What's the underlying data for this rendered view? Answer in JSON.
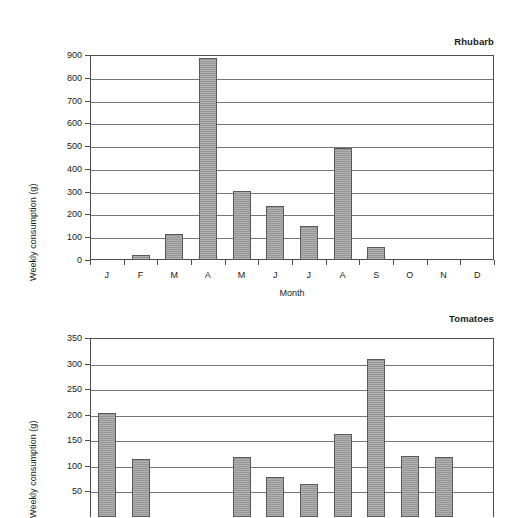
{
  "chart_data": [
    {
      "type": "bar",
      "title": "Rhubarb",
      "xlabel": "Month",
      "ylabel": "Weekly consumption (g)",
      "categories": [
        "J",
        "F",
        "M",
        "A",
        "M",
        "J",
        "J",
        "A",
        "S",
        "O",
        "N",
        "D"
      ],
      "values": [
        0,
        20,
        115,
        885,
        303,
        235,
        150,
        490,
        55,
        0,
        0,
        0
      ],
      "ylim": [
        0,
        900
      ],
      "ytick_labels": [
        "0",
        "100",
        "200",
        "300",
        "400",
        "500",
        "600",
        "700",
        "800",
        "900"
      ],
      "ytick_values": [
        0,
        100,
        200,
        300,
        400,
        500,
        600,
        700,
        800,
        900
      ],
      "grid": true,
      "legend": "none",
      "bar_color": "#a0a0a0",
      "bar_border_color": "#5a5a5a",
      "axis_color": "#4d4d4d",
      "grid_color": "#777777"
    },
    {
      "type": "bar",
      "title": "Tomatoes",
      "xlabel": "",
      "ylabel": "Weekly consumption (g)",
      "categories": [
        "J",
        "F",
        "M",
        "A",
        "M",
        "J",
        "J",
        "A",
        "S",
        "O",
        "N",
        "D"
      ],
      "values": [
        203,
        113,
        0,
        0,
        117,
        78,
        65,
        162,
        308,
        119,
        118,
        0
      ],
      "ylim": [
        0,
        350
      ],
      "ytick_labels": [
        "50",
        "100",
        "150",
        "200",
        "250",
        "300",
        "350"
      ],
      "ytick_values": [
        50,
        100,
        150,
        200,
        250,
        300,
        350
      ],
      "grid": true,
      "legend": "none",
      "cropped": "bottom of chart is cut off by image edge",
      "bar_color": "#a0a0a0",
      "bar_border_color": "#5a5a5a",
      "axis_color": "#4d4d4d",
      "grid_color": "#777777"
    }
  ]
}
